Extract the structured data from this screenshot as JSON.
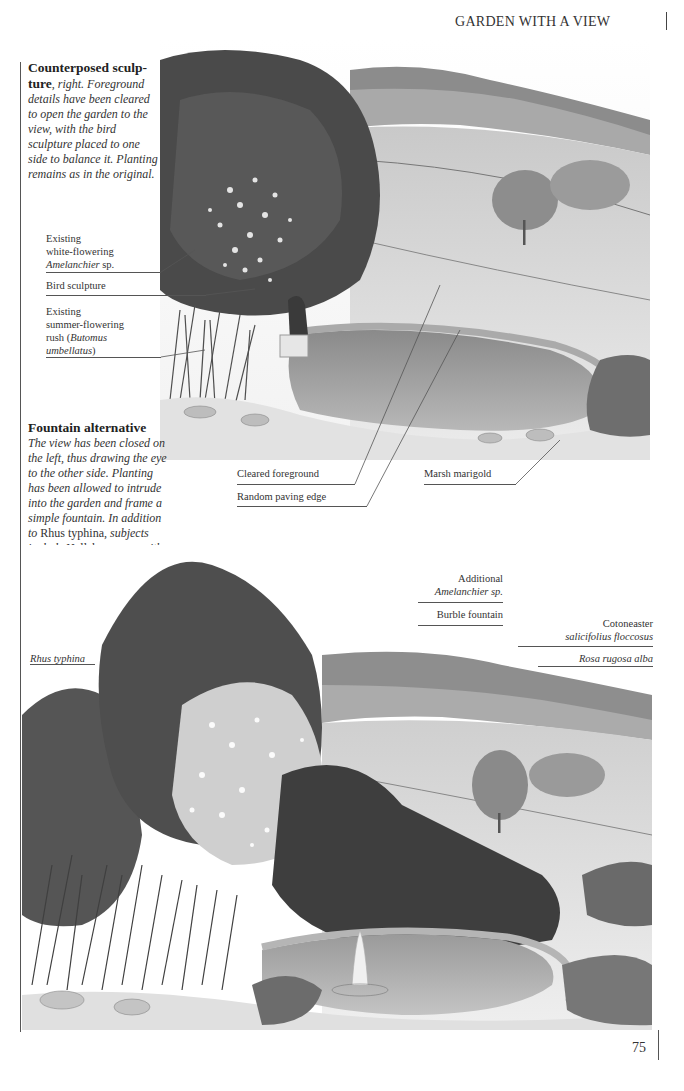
{
  "page": {
    "running_head": "GARDEN WITH A VIEW",
    "folio": "75"
  },
  "section1": {
    "title": "Counterposed sculp-ture",
    "title_suffix": ", ",
    "body_lead": "right.",
    "body": "Foreground details have been cleared to open the garden to the view, with the bird sculpture placed to one side to balance it. Planting remains as in the original.",
    "labels": {
      "amelanchier_line1": "Existing",
      "amelanchier_line2": "white-flowering",
      "amelanchier_line3_italic": "Amelanchier",
      "amelanchier_line3_rest": " sp.",
      "bird": "Bird sculpture",
      "rush_line1": "Existing",
      "rush_line2": "summer-flowering",
      "rush_line3": "rush (",
      "rush_line3_italic": "Butomus",
      "rush_line4_italic": "umbellatus",
      "rush_line4_rest": ")",
      "cleared": "Cleared foreground",
      "paving": "Random paving edge",
      "marigold": "Marsh marigold"
    }
  },
  "section2": {
    "title": "Fountain alternative",
    "body_italic_1": "The view has been closed on the left, thus drawing the eye to the other side. Planting has been allowed to intrude into the garden and frame a simple fountain. In addition to",
    "body_roman_1": " Rhus typhina,",
    "body_italic_2": " subjects include",
    "body_roman_2": " Helleborus",
    "body_italic_3": " sp., with",
    "body_roman_3": " Amelanchier",
    "body_italic_4": " sp. and",
    "body_roman_4": " Arundinaria sinensis.",
    "labels": {
      "rhus": "Rhus typhina",
      "additional_line1": "Additional",
      "additional_line2_italic": "Amelanchier",
      "additional_line2_rest": " sp.",
      "burble": "Burble fountain",
      "cotoneaster_line1": "Cotoneaster",
      "cotoneaster_line2": "salicifolius floccosus",
      "rosa": "Rosa rugosa alba"
    }
  },
  "colors": {
    "ink": "#2a2a2a",
    "foliage_dark": "#4a4a4a",
    "foliage_mid": "#7a7a7a",
    "field": "#d8d8d8",
    "water": "#9a9a9a"
  }
}
